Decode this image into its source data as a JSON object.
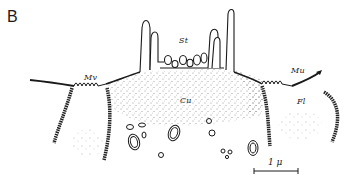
{
  "figure": {
    "panel_label": "B",
    "labels": {
      "mv_left": "Mv",
      "mv_right": "Mu",
      "st": "St",
      "cu": "Cu",
      "fl": "Fl"
    },
    "scale_bar": {
      "label": "1 μ",
      "length_px": 44
    },
    "colors": {
      "ink": "#1a1a1a",
      "background": "#ffffff"
    }
  }
}
